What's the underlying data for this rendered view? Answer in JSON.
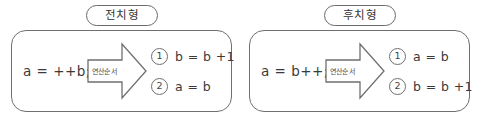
{
  "diagram": {
    "title_colors": {
      "outline": "#6f6f6f",
      "text": "#3a3a3a",
      "background": "#ffffff"
    },
    "panels": [
      {
        "caption": "전치형",
        "statement": "a  =  ++b;",
        "arrow_label": "연산순서",
        "results": [
          {
            "order": "1",
            "text": "b  =   b +1"
          },
          {
            "order": "2",
            "text": "a  =   b"
          }
        ]
      },
      {
        "caption": "후치형",
        "statement": "a  =  b++;",
        "arrow_label": "연산순서",
        "results": [
          {
            "order": "1",
            "text": "a  =  b"
          },
          {
            "order": "2",
            "text": "b  =  b +1"
          }
        ]
      }
    ]
  }
}
